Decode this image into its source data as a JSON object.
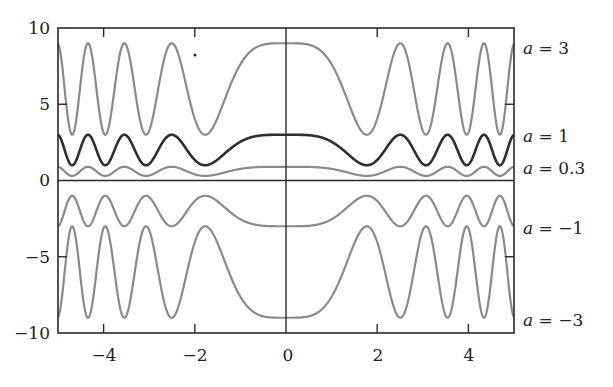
{
  "chart_data": {
    "type": "line",
    "title": "",
    "xlabel": "",
    "ylabel": "",
    "function": "y = a * (2 + cos(x^2))",
    "xlim": [
      -5,
      5
    ],
    "ylim": [
      -10,
      10
    ],
    "grid": false,
    "legend_position": "inline-right",
    "x_ticks": [
      -4,
      -2,
      0,
      2,
      4
    ],
    "x_tick_labels": [
      "−4",
      "−2",
      "0",
      "2",
      "4"
    ],
    "y_ticks": [
      -10,
      -5,
      0,
      5,
      10
    ],
    "y_tick_labels": [
      "−10",
      "−5",
      "0",
      "5",
      "10"
    ],
    "series": [
      {
        "name": "a = 3",
        "a": 3,
        "color": "#8a8a8a",
        "width": 2.2,
        "label_y": 8.9,
        "max": 9,
        "min": 3
      },
      {
        "name": "a = 1",
        "a": 1,
        "color": "#2e2e2e",
        "width": 2.6,
        "label_y": 2.6,
        "max": 3,
        "min": 1
      },
      {
        "name": "a = 0.3",
        "a": 0.3,
        "color": "#8a8a8a",
        "width": 2.2,
        "label_y": 0.55,
        "max": 0.9,
        "min": 0.3
      },
      {
        "name": "a = −1",
        "a": -1,
        "color": "#8a8a8a",
        "width": 2.2,
        "label_y": -3.3,
        "max": -1,
        "min": -3
      },
      {
        "name": "a = −3",
        "a": -3,
        "color": "#8a8a8a",
        "width": 2.2,
        "label_y": -9.1,
        "max": -3,
        "min": -9
      }
    ],
    "axes_lines": {
      "x_axis_at_y": 0,
      "y_axis_at_x": 0
    }
  },
  "labels": {
    "a3": {
      "var": "a",
      "eq": " = 3"
    },
    "a1": {
      "var": "a",
      "eq": " = 1"
    },
    "a03": {
      "var": "a",
      "eq": " = 0.3"
    },
    "am1": {
      "var": "a",
      "eq": " = −1"
    },
    "am3": {
      "var": "a",
      "eq": " = −3"
    }
  }
}
